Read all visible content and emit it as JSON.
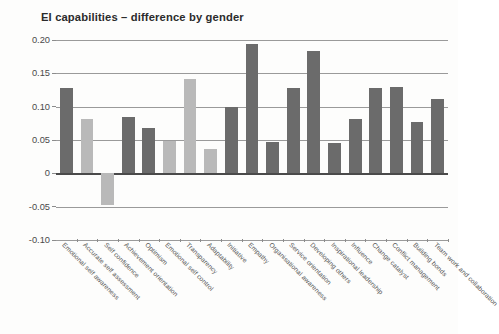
{
  "chart_data": {
    "type": "bar",
    "title": "EI capabilities – difference by gender",
    "xlabel": "",
    "ylabel": "",
    "ylim": [
      -0.1,
      0.2
    ],
    "yticks": [
      0.2,
      0.15,
      0.1,
      0.05,
      0,
      -0.05,
      -0.1
    ],
    "ytick_labels": [
      "0.20",
      "0.15",
      "0.10",
      "0.05",
      "0",
      "-0.05",
      "-0.10"
    ],
    "grid": true,
    "legend": "none",
    "categories": [
      "Emotional self awareness",
      "Accurate self assessment",
      "Self confidence",
      "Achievement orientation",
      "Optimism",
      "Emotional self control",
      "Transparency",
      "Adaptability",
      "Initiative",
      "Empathy",
      "Organisational awareness",
      "Service orientation",
      "Developing others",
      "Inspirational leadership",
      "Influence",
      "Change catalyst",
      "Conflict management",
      "Building bonds",
      "Team work and collaboration"
    ],
    "values": [
      0.128,
      0.082,
      -0.048,
      0.084,
      0.068,
      0.049,
      0.141,
      0.037,
      0.099,
      0.194,
      0.047,
      0.128,
      0.183,
      0.046,
      0.082,
      0.128,
      0.129,
      0.077,
      0.112
    ],
    "bar_shades": [
      "dark",
      "light",
      "light",
      "dark",
      "dark",
      "light",
      "light",
      "light",
      "dark",
      "dark",
      "dark",
      "dark",
      "dark",
      "dark",
      "dark",
      "dark",
      "dark",
      "dark",
      "dark"
    ],
    "colors": {
      "dark": "#6b6b6b",
      "light": "#b9b9b9",
      "gridline": "#9a9a9a",
      "axis": "#4a4a4a",
      "text": "#4a4a4a",
      "title": "#2b2b2b",
      "background": "#fdfdfc"
    }
  }
}
